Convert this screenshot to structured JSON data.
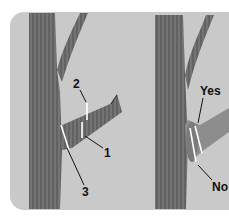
{
  "diagram": {
    "title": "",
    "left_panel": {
      "description": "Three-cut branch pruning method",
      "labels": {
        "cut1": "1",
        "cut2": "2",
        "cut3": "3"
      }
    },
    "right_panel": {
      "description": "Correct vs incorrect final cut at branch collar",
      "labels": {
        "correct": "Yes",
        "incorrect": "No"
      }
    },
    "colors": {
      "background": "#c9c9c9",
      "bark": "#6a6a6a",
      "cut_line": "#ffffff",
      "leader": "#111111"
    }
  }
}
